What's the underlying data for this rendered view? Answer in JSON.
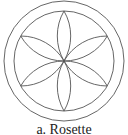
{
  "figure": {
    "caption": "a. Rosette",
    "stroke_color": "#555555",
    "background": "#ffffff",
    "center": [
      64,
      61
    ],
    "outer_circle_radius": 60,
    "inner_circle_radius": 50,
    "petal_count": 6
  }
}
